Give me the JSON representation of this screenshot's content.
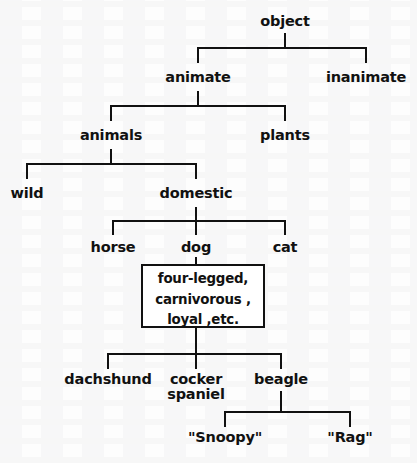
{
  "figure": {
    "type": "hierarchical-semantic-network",
    "title": "",
    "root": "object"
  },
  "nodes": {
    "object": {
      "label": "object",
      "x": 285,
      "y": 22
    },
    "animate": {
      "label": "animate",
      "x": 198,
      "y": 80
    },
    "inanimate": {
      "label": "inanimate",
      "x": 366,
      "y": 80
    },
    "animals": {
      "label": "animals",
      "x": 111,
      "y": 138
    },
    "plants": {
      "label": "plants",
      "x": 285,
      "y": 138
    },
    "wild": {
      "label": "wild",
      "x": 27,
      "y": 196
    },
    "domestic": {
      "label": "domestic",
      "x": 196,
      "y": 196
    },
    "horse": {
      "label": "horse",
      "x": 113,
      "y": 250
    },
    "dog": {
      "label": "dog",
      "x": 196,
      "y": 250
    },
    "cat": {
      "label": "cat",
      "x": 285,
      "y": 250
    },
    "dachshund": {
      "label": "dachshund",
      "x": 108,
      "y": 382
    },
    "cocker_spaniel": {
      "label": "cocker spaniel",
      "x": 196,
      "y": 382
    },
    "beagle": {
      "label": "beagle",
      "x": 281,
      "y": 382
    },
    "snoopy": {
      "label": "\"Snoopy\"",
      "x": 225,
      "y": 440
    },
    "rag": {
      "label": "\"Rag\"",
      "x": 350,
      "y": 440
    }
  },
  "property_box": {
    "name": "dog-properties-box",
    "lines": [
      "four-legged,",
      "carnivorous ,",
      "loyal ,etc."
    ],
    "x": 141,
    "y": 264,
    "width": 124,
    "height": 64
  },
  "edges": [
    {
      "parent": "object",
      "children": [
        "animate",
        "inanimate"
      ]
    },
    {
      "parent": "animate",
      "children": [
        "animals",
        "plants"
      ]
    },
    {
      "parent": "animals",
      "children": [
        "wild",
        "domestic"
      ]
    },
    {
      "parent": "domestic",
      "children": [
        "horse",
        "dog",
        "cat"
      ]
    },
    {
      "parent": "dog",
      "children": [
        "dog-properties-box"
      ]
    },
    {
      "parent": "dog-properties-box",
      "children": [
        "dachshund",
        "cocker_spaniel",
        "beagle"
      ]
    },
    {
      "parent": "beagle",
      "children": [
        "snoopy",
        "rag"
      ]
    }
  ],
  "style": {
    "ink": "#111111",
    "paper": "#ffffff",
    "line_width": 2
  }
}
